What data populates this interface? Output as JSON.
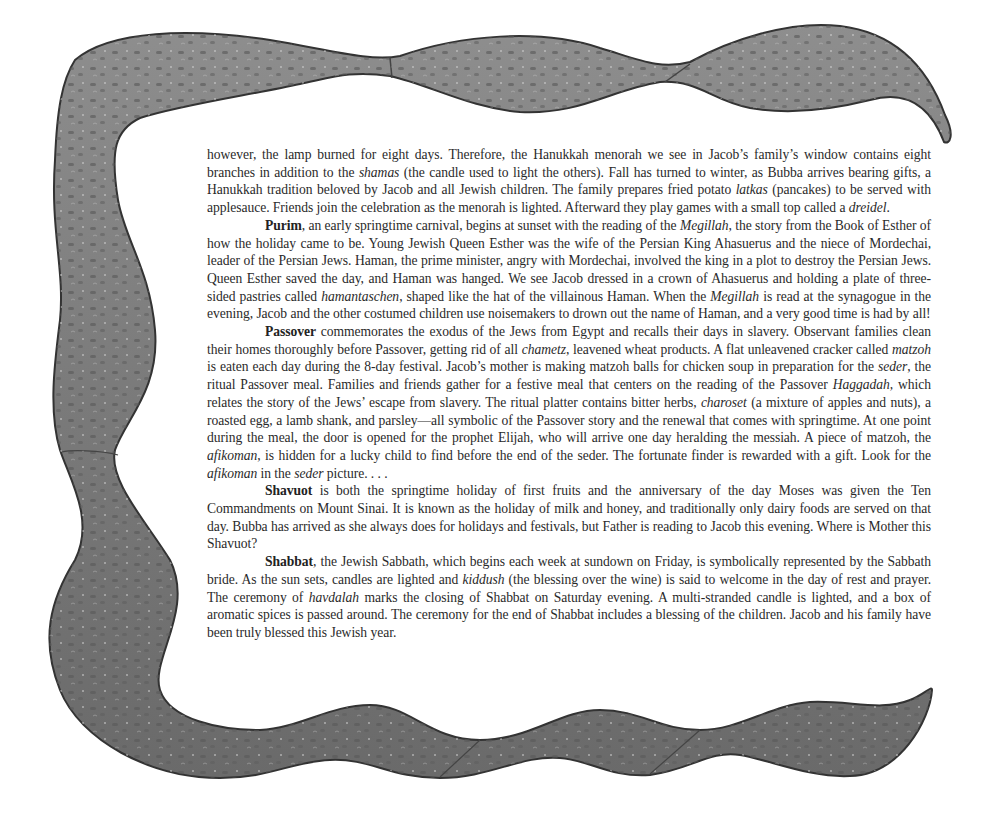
{
  "page": {
    "colors": {
      "background": "#ffffff",
      "text": "#2a2a2a",
      "ribbon_fill": "#7d7d7d",
      "ribbon_dark": "#3e3e3e",
      "ribbon_light": "#b5b5b5"
    }
  },
  "paragraphs": [
    {
      "id": "hanukkah-continued",
      "indent": false,
      "segments": [
        {
          "text": "however, the lamp burned for eight days. Therefore, the Hanukkah menorah we see in Jacob’s family’s window contains eight branches in addition to the ",
          "style": "normal"
        },
        {
          "text": "shamas",
          "style": "italic"
        },
        {
          "text": " (the candle used to light the others).  Fall has turned to winter, as Bubba arrives bearing gifts, a Hanukkah tradition beloved by Jacob and all Jewish children.  The family prepares fried potato ",
          "style": "normal"
        },
        {
          "text": "latkas",
          "style": "italic"
        },
        {
          "text": " (pancakes) to be served with applesauce.  Friends join the celebration as the menorah is lighted. Afterward they play games with a small top called a ",
          "style": "normal"
        },
        {
          "text": "dreidel",
          "style": "italic"
        },
        {
          "text": ".",
          "style": "normal"
        }
      ]
    },
    {
      "id": "purim",
      "indent": true,
      "segments": [
        {
          "text": "Purim",
          "style": "bold"
        },
        {
          "text": ", an early springtime carnival, begins at sunset with the reading of the ",
          "style": "normal"
        },
        {
          "text": "Megillah",
          "style": "italic"
        },
        {
          "text": ", the story from the Book of Esther of how the holiday came to be. Young Jewish Queen Esther was the wife of the Persian King Ahasuerus and the niece of Mordechai, leader of the Persian Jews. Haman, the prime minister, angry with Mordechai, involved the king in a plot to destroy the Persian Jews. Queen Esther saved the day, and Haman was hanged. We see Jacob dressed in a crown of Ahasuerus and holding a plate of three-sided pastries called ",
          "style": "normal"
        },
        {
          "text": "hamantaschen",
          "style": "italic"
        },
        {
          "text": ", shaped like the hat of the villainous Haman. When the ",
          "style": "normal"
        },
        {
          "text": "Megillah",
          "style": "italic"
        },
        {
          "text": " is read at the synagogue in the evening, Jacob and the other costumed children use noisemakers to drown out the name of Haman, and a very good time is had by all!",
          "style": "normal"
        }
      ]
    },
    {
      "id": "passover",
      "indent": true,
      "segments": [
        {
          "text": "Passover",
          "style": "bold"
        },
        {
          "text": " commemorates the exodus of the Jews from Egypt and recalls their days in slavery. Observant families clean their homes thoroughly before Passover, getting rid of all ",
          "style": "normal"
        },
        {
          "text": "chametz",
          "style": "italic"
        },
        {
          "text": ", leavened wheat products. A flat unleavened cracker called ",
          "style": "normal"
        },
        {
          "text": "matzoh",
          "style": "italic"
        },
        {
          "text": " is eaten each day during the 8-day festival. Jacob’s mother is making matzoh balls for chicken soup in preparation for the ",
          "style": "normal"
        },
        {
          "text": "seder",
          "style": "italic"
        },
        {
          "text": ", the ritual Passover meal.  Families and friends gather for a festive meal that centers on the reading of the Passover ",
          "style": "normal"
        },
        {
          "text": "Haggadah,",
          "style": "italic"
        },
        {
          "text": " which relates the story of the Jews’ escape from slavery. The ritual platter contains bitter herbs, ",
          "style": "normal"
        },
        {
          "text": "charoset",
          "style": "italic"
        },
        {
          "text": " (a mixture of apples and nuts), a roasted egg, a lamb shank, and parsley—all symbolic of the Passover story and the renewal that comes with springtime. At one point during the meal, the door is opened for the prophet Elijah, who will arrive one day heralding the messiah. A piece of matzoh, the ",
          "style": "normal"
        },
        {
          "text": "afikoman",
          "style": "italic"
        },
        {
          "text": ", is hidden for a lucky child to find before the end of the seder. The fortunate finder is rewarded with a gift. Look for the ",
          "style": "normal"
        },
        {
          "text": "afikoman",
          "style": "italic"
        },
        {
          "text": " in the ",
          "style": "normal"
        },
        {
          "text": "seder",
          "style": "italic"
        },
        {
          "text": " picture. . . .",
          "style": "normal"
        }
      ]
    },
    {
      "id": "shavuot",
      "indent": true,
      "segments": [
        {
          "text": "Shavuot",
          "style": "bold"
        },
        {
          "text": " is both the springtime holiday of first fruits and the anniversary of the day Moses was given the Ten Commandments on Mount Sinai. It is known as the holiday of milk and honey, and traditionally only dairy foods are served on that day. Bubba has arrived as she always does for holidays and festivals, but Father is reading to Jacob this evening. Where is Mother this Shavuot?",
          "style": "normal"
        }
      ]
    },
    {
      "id": "shabbat",
      "indent": true,
      "segments": [
        {
          "text": "Shabbat",
          "style": "bold"
        },
        {
          "text": ", the Jewish Sabbath, which begins each week at sundown on Friday, is symbolically represented  by the Sabbath bride. As the sun sets, candles are lighted and ",
          "style": "normal"
        },
        {
          "text": "kiddush",
          "style": "italic"
        },
        {
          "text": " (the blessing over the wine) is said to welcome in the day of rest and prayer. The ceremony of ",
          "style": "normal"
        },
        {
          "text": "havdalah",
          "style": "italic"
        },
        {
          "text": " marks the closing of Shabbat on Saturday evening. A multi-stranded candle is lighted, and a box of aromatic spices is passed around. The ceremony for the end of Shabbat includes a blessing of the children. Jacob and his family have been truly blessed this Jewish year.",
          "style": "normal"
        }
      ]
    }
  ],
  "decoration": {
    "frame": "hand-painted wavy gray ribbon border (top, left, bottom)",
    "ribbon_icon": "wavy-ribbon-border"
  }
}
